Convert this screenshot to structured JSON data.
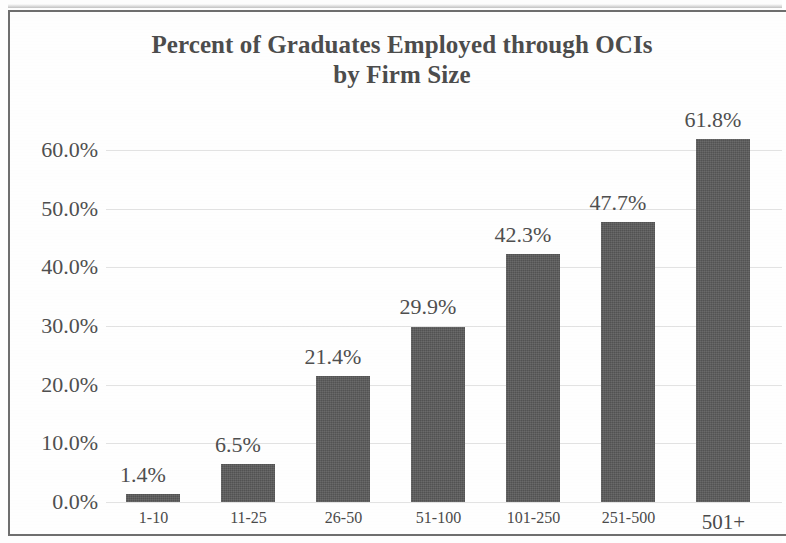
{
  "chart_data": {
    "type": "bar",
    "title": "Percent of Graduates Employed through OCIs by Firm Size",
    "title_line1": "Percent of Graduates Employed through OCIs",
    "title_line2": "by Firm Size",
    "xlabel": "",
    "ylabel": "",
    "categories": [
      "1-10",
      "11-25",
      "26-50",
      "51-100",
      "101-250",
      "251-500",
      "501+"
    ],
    "values": [
      1.4,
      6.5,
      21.4,
      29.9,
      42.3,
      47.7,
      61.8
    ],
    "value_labels": [
      "1.4%",
      "6.5%",
      "21.4%",
      "29.9%",
      "42.3%",
      "47.7%",
      "61.8%"
    ],
    "ylim": [
      0,
      65
    ],
    "ytick_values": [
      0,
      10,
      20,
      30,
      40,
      50,
      60
    ],
    "ytick_labels": [
      "0.0%",
      "10.0%",
      "20.0%",
      "30.0%",
      "40.0%",
      "50.0%",
      "60.0%"
    ],
    "grid": true,
    "grid_axis": "y",
    "legend": false,
    "bar_color": "#595959",
    "text_color": "#4f4f4f",
    "title_color": "#4c4c4c",
    "gridline_color": "#e2e2e2",
    "frame_color": "#6e6e6e",
    "background_color": "#fefefe"
  }
}
